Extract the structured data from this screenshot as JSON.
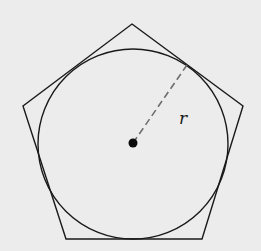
{
  "diagram": {
    "background": "#ececec",
    "stroke_color": "#1a1a1a",
    "dash_color": "#6e6e6e",
    "pentagon": {
      "vertices": [
        [
          132,
          24
        ],
        [
          243,
          106
        ],
        [
          202,
          239
        ],
        [
          66,
          239
        ],
        [
          23,
          106
        ]
      ]
    },
    "circle": {
      "cx": 133,
      "cy": 144,
      "r": 95
    },
    "center_point": {
      "cx": 133,
      "cy": 143,
      "r": 4.5
    },
    "radius_line": {
      "x1": 133,
      "y1": 143,
      "x2": 187,
      "y2": 65,
      "style": "dashed"
    },
    "radius_label": {
      "text": "r",
      "x": 179,
      "y": 124
    }
  }
}
